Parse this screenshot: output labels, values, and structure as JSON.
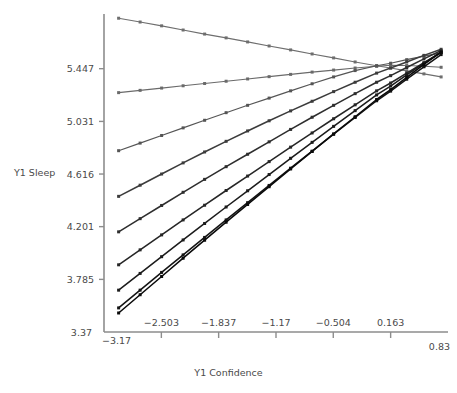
{
  "chart_data": {
    "type": "line",
    "title": "",
    "xlabel": "Y1 Confidence",
    "ylabel": "Y1 Sleep",
    "xlim": [
      -3.17,
      0.83
    ],
    "ylim": [
      3.37,
      5.8625
    ],
    "xticks": [
      -3.17,
      -2.503,
      -1.837,
      -1.17,
      -0.504,
      0.163,
      0.83
    ],
    "xticklabels": [
      "−3.17",
      "−2.503",
      "−1.837",
      "−1.17",
      "−0.504",
      "0.163",
      "0.83"
    ],
    "yticks": [
      3.37,
      3.785,
      4.201,
      4.616,
      5.031,
      5.447
    ],
    "yticklabels": [
      "3.37",
      "3.785",
      "4.201",
      "4.616",
      "5.031",
      "5.447"
    ],
    "grid": false,
    "legend": false,
    "legend_position": "none",
    "marker": "square",
    "x": [
      -3.0,
      -2.75,
      -2.5,
      -2.25,
      -2.0,
      -1.75,
      -1.5,
      -1.25,
      -1.0,
      -0.75,
      -0.5,
      -0.25,
      0.0,
      0.163,
      0.35,
      0.55,
      0.75
    ],
    "series": [
      {
        "name": "Series 1",
        "color": "#6e6e6e",
        "values": [
          5.845,
          5.815,
          5.785,
          5.752,
          5.72,
          5.69,
          5.658,
          5.626,
          5.595,
          5.563,
          5.532,
          5.5,
          5.47,
          5.452,
          5.43,
          5.406,
          5.382
        ]
      },
      {
        "name": "Series 2",
        "color": "#6a6a6a",
        "values": [
          5.258,
          5.276,
          5.294,
          5.312,
          5.33,
          5.348,
          5.366,
          5.384,
          5.402,
          5.42,
          5.436,
          5.452,
          5.466,
          5.474,
          5.472,
          5.466,
          5.458
        ]
      },
      {
        "name": "Series 3",
        "color": "#555555",
        "values": [
          4.8,
          4.86,
          4.92,
          4.98,
          5.04,
          5.1,
          5.158,
          5.215,
          5.272,
          5.328,
          5.382,
          5.432,
          5.47,
          5.49,
          5.518,
          5.546,
          5.572
        ]
      },
      {
        "name": "Series 4",
        "color": "#3c3c3c",
        "values": [
          4.44,
          4.528,
          4.616,
          4.704,
          4.79,
          4.874,
          4.956,
          5.036,
          5.114,
          5.19,
          5.266,
          5.34,
          5.412,
          5.452,
          5.5,
          5.552,
          5.6
        ]
      },
      {
        "name": "Series 5",
        "color": "#2e2e2e",
        "values": [
          4.16,
          4.264,
          4.368,
          4.472,
          4.574,
          4.674,
          4.772,
          4.87,
          4.968,
          5.064,
          5.158,
          5.25,
          5.34,
          5.392,
          5.456,
          5.524,
          5.59
        ]
      },
      {
        "name": "Series 6",
        "color": "#262626",
        "values": [
          3.9,
          4.018,
          4.136,
          4.254,
          4.37,
          4.486,
          4.6,
          4.714,
          4.828,
          4.94,
          5.052,
          5.162,
          5.272,
          5.334,
          5.412,
          5.494,
          5.574
        ]
      },
      {
        "name": "Series 7",
        "color": "#1c1c1c",
        "values": [
          3.7,
          3.832,
          3.964,
          4.096,
          4.226,
          4.356,
          4.484,
          4.612,
          4.74,
          4.866,
          4.992,
          5.116,
          5.24,
          5.31,
          5.398,
          5.49,
          5.58
        ]
      },
      {
        "name": "Series 8",
        "color": "#141414",
        "values": [
          3.56,
          3.7,
          3.84,
          3.978,
          4.116,
          4.254,
          4.39,
          4.526,
          4.662,
          4.796,
          4.93,
          5.062,
          5.194,
          5.27,
          5.364,
          5.462,
          5.558
        ]
      },
      {
        "name": "Series 9",
        "color": "#0a0a0a",
        "values": [
          3.52,
          3.664,
          3.808,
          3.952,
          4.094,
          4.236,
          4.376,
          4.516,
          4.656,
          4.794,
          4.932,
          5.068,
          5.204,
          5.282,
          5.378,
          5.48,
          5.578
        ]
      }
    ]
  },
  "axes": {
    "x_title": "Y1 Confidence",
    "y_title": "Y1 Sleep"
  }
}
